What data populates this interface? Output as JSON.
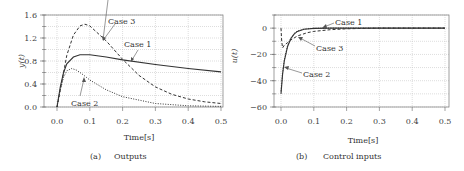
{
  "chart_data": [
    {
      "id": "a",
      "type": "line",
      "caption_tag": "(a)",
      "caption": "Outputs",
      "xlabel": "Time[s]",
      "ylabel": "y(t)",
      "xlim": [
        0,
        0.5
      ],
      "ylim": [
        0,
        1.6
      ],
      "xticks": [
        "0.0",
        "0.1",
        "0.2",
        "0.3",
        "0.4",
        "0.5"
      ],
      "yticks": [
        "0.0",
        "0.4",
        "0.8",
        "1.2",
        "1.6"
      ],
      "grid": true,
      "series": [
        {
          "name": "Case 1",
          "style": "solid",
          "x": [
            0,
            0.01,
            0.02,
            0.03,
            0.05,
            0.07,
            0.1,
            0.15,
            0.2,
            0.3,
            0.4,
            0.5
          ],
          "y": [
            0,
            0.35,
            0.6,
            0.75,
            0.87,
            0.91,
            0.91,
            0.87,
            0.82,
            0.74,
            0.67,
            0.61
          ]
        },
        {
          "name": "Case 2",
          "style": "dotted",
          "x": [
            0,
            0.01,
            0.02,
            0.03,
            0.045,
            0.06,
            0.08,
            0.1,
            0.15,
            0.2,
            0.3,
            0.4,
            0.5
          ],
          "y": [
            0,
            0.3,
            0.52,
            0.63,
            0.67,
            0.64,
            0.56,
            0.47,
            0.3,
            0.18,
            0.06,
            0.02,
            0.01
          ]
        },
        {
          "name": "Case 3",
          "style": "dashed",
          "x": [
            0,
            0.01,
            0.02,
            0.03,
            0.05,
            0.07,
            0.085,
            0.1,
            0.15,
            0.2,
            0.25,
            0.3,
            0.35,
            0.4,
            0.45,
            0.5
          ],
          "y": [
            0,
            0.3,
            0.6,
            0.9,
            1.25,
            1.41,
            1.44,
            1.41,
            1.15,
            0.83,
            0.55,
            0.35,
            0.22,
            0.14,
            0.09,
            0.06
          ]
        }
      ],
      "annotations": [
        {
          "text": "Case 1",
          "series": "Case 1"
        },
        {
          "text": "Case 2",
          "series": "Case 2"
        },
        {
          "text": "Case 3",
          "series": "Case 3"
        }
      ]
    },
    {
      "id": "b",
      "type": "line",
      "caption_tag": "(b)",
      "caption": "Control inputs",
      "xlabel": "Time[s]",
      "ylabel": "u(t)",
      "xlim": [
        0,
        0.5
      ],
      "ylim": [
        -60,
        10
      ],
      "xticks": [
        "0.0",
        "0.1",
        "0.2",
        "0.3",
        "0.4",
        "0.5"
      ],
      "yticks": [
        "0",
        "-20",
        "-40",
        "-60"
      ],
      "grid": true,
      "series": [
        {
          "name": "Case 1",
          "style": "solid",
          "x": [
            0,
            0.005,
            0.01,
            0.02,
            0.03,
            0.04,
            0.05,
            0.07,
            0.1,
            0.15,
            0.2,
            0.5
          ],
          "y": [
            -50,
            -35,
            -25,
            -14,
            -8,
            -4.5,
            -2.5,
            -0.8,
            -0.2,
            0,
            0,
            0
          ]
        },
        {
          "name": "Case 2",
          "style": "dotted",
          "x": [
            0,
            0.005,
            0.01,
            0.02,
            0.03,
            0.04,
            0.05,
            0.07,
            0.1,
            0.15,
            0.5
          ],
          "y": [
            -48,
            -34,
            -24,
            -13,
            -7.5,
            -4,
            -2.2,
            -0.7,
            -0.1,
            0,
            0
          ]
        },
        {
          "name": "Case 3",
          "style": "dashed",
          "x": [
            0,
            0.002,
            0.005,
            0.01,
            0.02,
            0.03,
            0.05,
            0.08,
            0.1,
            0.15,
            0.2,
            0.25,
            0.3,
            0.5
          ],
          "y": [
            0,
            -10,
            -15,
            -13,
            -11,
            -9,
            -6,
            -3.5,
            -2.5,
            -1.2,
            -0.5,
            -0.2,
            0,
            0
          ]
        }
      ],
      "annotations": [
        {
          "text": "Case 1",
          "series": "Case 1"
        },
        {
          "text": "Case 2",
          "series": "Case 2"
        },
        {
          "text": "Case 3",
          "series": "Case 3"
        }
      ]
    }
  ]
}
